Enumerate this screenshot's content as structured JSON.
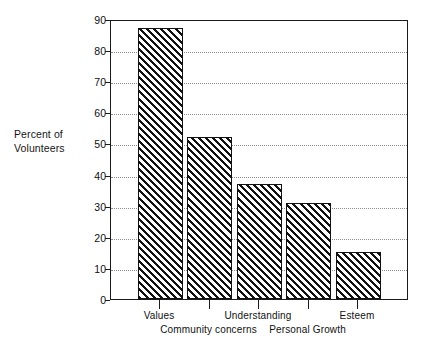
{
  "chart_data": {
    "type": "bar",
    "title": "",
    "subtitle": "",
    "xlabel": "",
    "ylabel": "Percent of Volunteers",
    "ylabel_lines": [
      "Percent of",
      "Volunteers"
    ],
    "categories": [
      "Values",
      "Community concerns",
      "Understanding",
      "Personal Growth",
      "Esteem"
    ],
    "values": [
      87,
      52,
      37,
      31,
      15
    ],
    "ylim": [
      0,
      90
    ],
    "ytick_labels": [
      "0",
      "10",
      "20",
      "30",
      "40",
      "50",
      "60",
      "70",
      "80",
      "90"
    ],
    "ytick_values": [
      0,
      10,
      20,
      30,
      40,
      50,
      60,
      70,
      80,
      90
    ],
    "grid": true,
    "grid_style": "dotted-horizontal",
    "legend": "none",
    "bar_fill": "diagonal-hatch",
    "bar_color": "#111111",
    "background": "#ffffff",
    "label_rows": [
      {
        "row": 1,
        "labels": [
          "Values",
          "Understanding",
          "Esteem"
        ],
        "category_indices": [
          0,
          2,
          4
        ]
      },
      {
        "row": 2,
        "labels": [
          "Community concerns",
          "Personal Growth"
        ],
        "category_indices": [
          1,
          3
        ]
      }
    ]
  }
}
